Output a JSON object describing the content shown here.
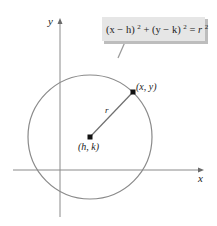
{
  "diagram": {
    "equation": {
      "lhs_1": "(x − h)",
      "exp_1": "2",
      "plus": " + ",
      "lhs_2": "(y − k)",
      "exp_2": "2",
      "eq": " = ",
      "rhs": "r",
      "exp_3": "2"
    },
    "axes": {
      "x_label": "x",
      "y_label": "y"
    },
    "center_label": "(h, k)",
    "point_label": "(x, y)",
    "radius_label": "r",
    "colors": {
      "circle": "#808080",
      "axes": "#808080",
      "callout_fill": "#e4e4e4",
      "callout_shadow": "#b8b8b8",
      "points": "#111111"
    }
  }
}
